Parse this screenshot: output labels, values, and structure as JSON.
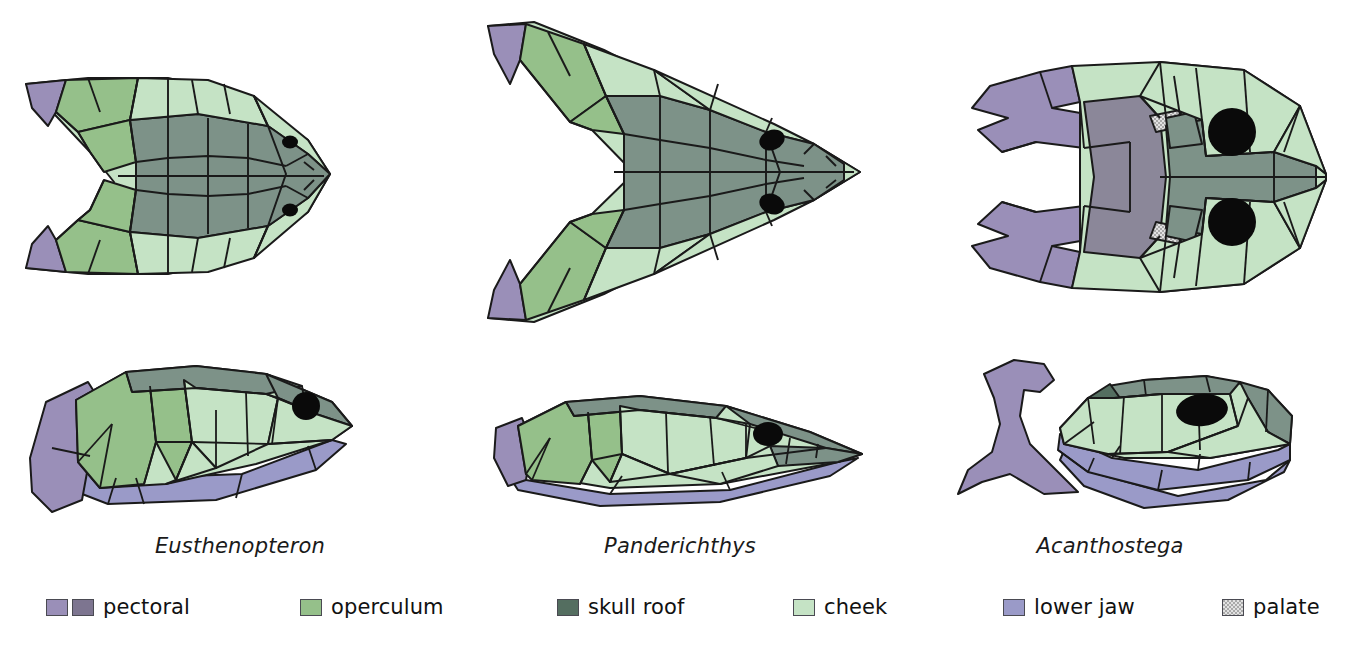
{
  "figure": {
    "background_color": "#ffffff",
    "views": [
      "dorsal",
      "lateral"
    ]
  },
  "palette": {
    "pectoral_light": "#9a8fb8",
    "pectoral_dark": "#7d7590",
    "operculum": "#95c08a",
    "skull_roof": "#7d9288",
    "cheek": "#c5e3c5",
    "lower_jaw": "#9a9ac8",
    "palate": "#b9b9bd",
    "palate_solid": "#8b8799",
    "orbit": "#0a0a0a",
    "outline": "#1a1a1a",
    "midline": "#1a1a1a"
  },
  "species": [
    {
      "id": "eusthenopteron",
      "name": "Eusthenopteron"
    },
    {
      "id": "panderichthys",
      "name": "Panderichthys"
    },
    {
      "id": "acanthostega",
      "name": "Acanthostega"
    }
  ],
  "legend": {
    "items": [
      {
        "id": "pectoral",
        "label": "pectoral",
        "swatches": [
          "#9a8fb8",
          "#7d7590"
        ],
        "textured": false
      },
      {
        "id": "operculum",
        "label": "operculum",
        "swatches": [
          "#95c08a"
        ],
        "textured": false
      },
      {
        "id": "skull-roof",
        "label": "skull roof",
        "swatches": [
          "#546e60"
        ],
        "textured": false
      },
      {
        "id": "cheek",
        "label": "cheek",
        "swatches": [
          "#c5e3c5"
        ],
        "textured": false
      },
      {
        "id": "lower-jaw",
        "label": "lower jaw",
        "swatches": [
          "#9a9ac8"
        ],
        "textured": false
      },
      {
        "id": "palate",
        "label": "palate",
        "swatches": [
          "#c9c9c9"
        ],
        "textured": true
      }
    ]
  },
  "panels": [
    {
      "id": "eusthenopteron-dorsal",
      "species": "Eusthenopteron",
      "view": "dorsal",
      "orbits": 2,
      "has_pectoral": true,
      "rear_notch": "shallow-v",
      "snout": "pointed"
    },
    {
      "id": "panderichthys-dorsal",
      "species": "Panderichthys",
      "view": "dorsal",
      "orbits": 2,
      "has_pectoral": true,
      "rear_notch": "deep-v",
      "snout": "long-pointed"
    },
    {
      "id": "acanthostega-dorsal",
      "species": "Acanthostega",
      "view": "dorsal",
      "orbits": 2,
      "has_pectoral": true,
      "has_palate": true,
      "rear_notch": "detached-girdle",
      "snout": "blunt-rounded"
    },
    {
      "id": "eusthenopteron-lateral",
      "species": "Eusthenopteron",
      "view": "lateral",
      "orbits": 1,
      "has_pectoral": true,
      "has_lower_jaw": true
    },
    {
      "id": "panderichthys-lateral",
      "species": "Panderichthys",
      "view": "lateral",
      "orbits": 1,
      "has_pectoral": true,
      "has_lower_jaw": true
    },
    {
      "id": "acanthostega-lateral",
      "species": "Acanthostega",
      "view": "lateral",
      "orbits": 1,
      "has_pectoral": true,
      "has_lower_jaw": true,
      "pectoral_detached": true
    }
  ]
}
